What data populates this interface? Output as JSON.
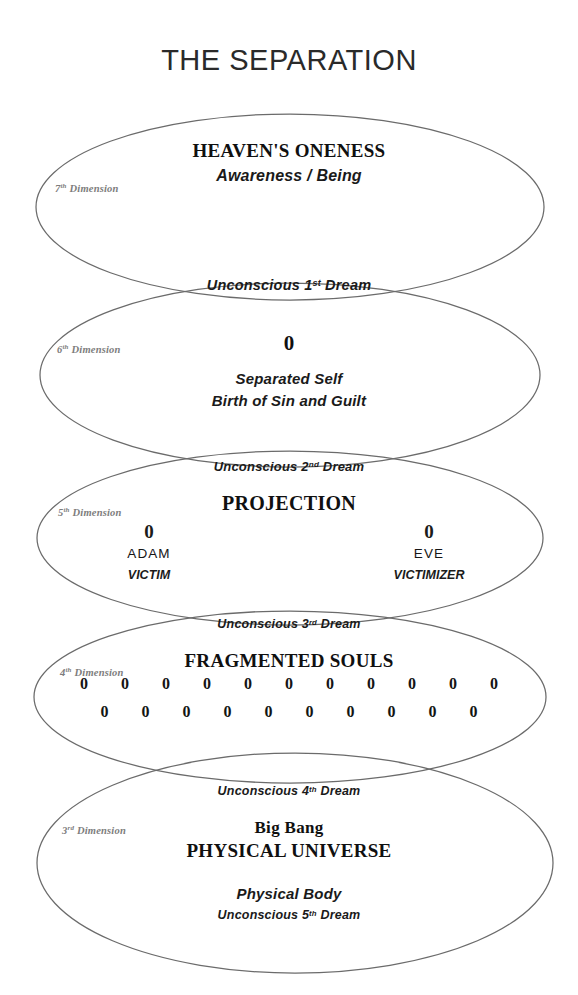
{
  "title": "THE SEPARATION",
  "bands": {
    "seventh": {
      "dimension_label": "7",
      "dimension_ord": "th",
      "dimension_word": "Dimension",
      "heading": "HEAVEN'S ONENESS",
      "subheading": "Awareness / Being"
    },
    "sixth": {
      "dimension_label": "6",
      "dimension_ord": "th",
      "dimension_word": "Dimension",
      "symbol": "0",
      "line1": "Separated Self",
      "line2": "Birth of Sin and Guilt"
    },
    "fifth": {
      "dimension_label": "5",
      "dimension_ord": "th",
      "dimension_word": "Dimension",
      "heading": "PROJECTION",
      "left": {
        "symbol": "0",
        "name": "ADAM",
        "role": "VICTIM"
      },
      "right": {
        "symbol": "0",
        "name": "EVE",
        "role": "VICTIMIZER"
      }
    },
    "fourth": {
      "dimension_label": "4",
      "dimension_ord": "th",
      "dimension_word": "Dimension",
      "heading": "FRAGMENTED SOULS",
      "row1": [
        "0",
        "0",
        "0",
        "0",
        "0",
        "0",
        "0",
        "0",
        "0",
        "0",
        "0"
      ],
      "row2": [
        "0",
        "0",
        "0",
        "0",
        "0",
        "0",
        "0",
        "0",
        "0",
        "0"
      ],
      "row1_count": 11,
      "row2_count": 10
    },
    "third": {
      "dimension_label": "3",
      "dimension_ord": "rd",
      "dimension_word": "Dimension",
      "line1": "Big Bang",
      "line2": "PHYSICAL UNIVERSE",
      "line3": "Physical Body",
      "line4_prefix": "Unconscious ",
      "line4_num": "5",
      "line4_ord": "th",
      "line4_suffix": " Dream"
    }
  },
  "overlaps": [
    {
      "prefix": "Unconscious ",
      "num": "1",
      "ord": "st",
      "suffix": " Dream"
    },
    {
      "prefix": "Unconscious ",
      "num": "2",
      "ord": "nd",
      "suffix": " Dream"
    },
    {
      "prefix": "Unconscious ",
      "num": "3",
      "ord": "rd",
      "suffix": " Dream"
    },
    {
      "prefix": "Unconscious ",
      "num": "4",
      "ord": "th",
      "suffix": " Dream"
    }
  ],
  "style": {
    "stroke_color": "#6b6b6b",
    "background": "#ffffff",
    "text_color": "#101010",
    "dimension_label_color": "#7d7d7d"
  }
}
